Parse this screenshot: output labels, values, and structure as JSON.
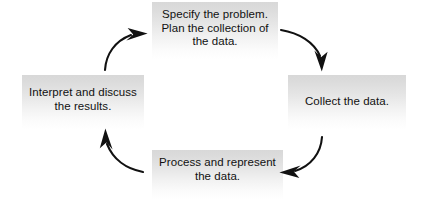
{
  "diagram": {
    "type": "cycle",
    "background_color": "#ffffff",
    "text_color": "#111111",
    "box_gradient_top": "#d8d8d8",
    "box_gradient_bottom": "#ffffff",
    "arrow_color": "#111111",
    "stages": [
      {
        "id": "specify",
        "label": "Specify the problem.\nPlan the collection of\nthe data.",
        "position": "top"
      },
      {
        "id": "collect",
        "label": "Collect the data.",
        "position": "right"
      },
      {
        "id": "process",
        "label": "Process and represent\nthe data.",
        "position": "bottom"
      },
      {
        "id": "interpret",
        "label": "Interpret and discuss\nthe results.",
        "position": "left"
      }
    ],
    "arrows": [
      {
        "id": "specify-to-collect",
        "from": "specify",
        "to": "collect",
        "direction": "clockwise",
        "points_to": "down"
      },
      {
        "id": "collect-to-process",
        "from": "collect",
        "to": "process",
        "direction": "clockwise",
        "points_to": "left"
      },
      {
        "id": "process-to-interpret",
        "from": "process",
        "to": "interpret",
        "direction": "clockwise",
        "points_to": "up"
      },
      {
        "id": "interpret-to-specify",
        "from": "interpret",
        "to": "specify",
        "direction": "clockwise",
        "points_to": "right"
      }
    ]
  }
}
